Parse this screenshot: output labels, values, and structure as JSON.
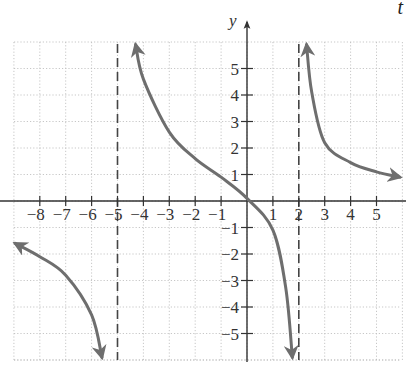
{
  "corner_label": "t",
  "chart_data": {
    "type": "line",
    "title": "",
    "xlabel": "",
    "ylabel": "y",
    "xlim": [
      -9,
      6
    ],
    "ylim": [
      -6,
      6
    ],
    "grid": true,
    "x_ticks": [
      -8,
      -7,
      -6,
      -5,
      -4,
      -3,
      -2,
      -1,
      1,
      2,
      3,
      4,
      5
    ],
    "x_tick_labels": [
      "−8",
      "−7",
      "−6",
      "−5",
      "−4",
      "−3",
      "−2",
      "−1",
      "1",
      "2",
      "3",
      "4",
      "5"
    ],
    "y_ticks": [
      5,
      4,
      3,
      2,
      1,
      -1,
      -2,
      -3,
      -4,
      -5
    ],
    "y_tick_labels": [
      "5",
      "4",
      "3",
      "2",
      "1",
      "−1",
      "−2",
      "−3",
      "−4",
      "−5"
    ],
    "vertical_asymptotes": [
      -5,
      2
    ],
    "series": [
      {
        "name": "left-branch",
        "x": [
          -8.95,
          -8,
          -7,
          -6,
          -5.6
        ],
        "y": [
          -1.6,
          -2.1,
          -2.8,
          -4.3,
          -5.9
        ],
        "arrows": "both"
      },
      {
        "name": "middle-branch",
        "x": [
          -4.3,
          -4,
          -3,
          -2,
          -1,
          0,
          1,
          1.5,
          1.75
        ],
        "y": [
          5.9,
          4.6,
          2.6,
          1.6,
          0.9,
          0.1,
          -1.1,
          -3.3,
          -5.9
        ],
        "arrows": "both"
      },
      {
        "name": "right-branch",
        "x": [
          2.3,
          2.5,
          3,
          4,
          5,
          5.9
        ],
        "y": [
          5.9,
          4.1,
          2.2,
          1.45,
          1.1,
          0.9
        ],
        "arrows": "both"
      }
    ],
    "colors": {
      "curve": "#6e6e6e",
      "axis": "#333333",
      "grid": "#b9b9b9",
      "asymptote": "#444444"
    }
  }
}
